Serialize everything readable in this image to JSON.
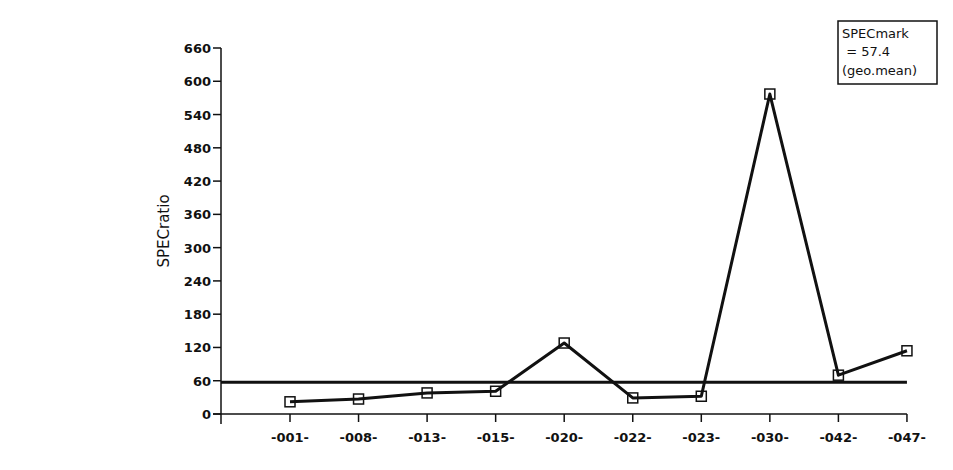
{
  "chart_data": {
    "type": "line",
    "title": "",
    "xlabel": "",
    "ylabel": "SPECratio",
    "categories": [
      "-001-",
      "-008-",
      "-013-",
      "-015-",
      "-020-",
      "-022-",
      "-023-",
      "-030-",
      "-042-",
      "-047-"
    ],
    "series": [
      {
        "name": "SPECratio",
        "values": [
          22,
          27,
          38,
          41,
          128,
          29,
          32,
          577,
          70,
          114
        ]
      }
    ],
    "reference_line": {
      "label": "geo.mean",
      "value": 57.4
    },
    "yticks": [
      0,
      60,
      120,
      180,
      240,
      300,
      360,
      420,
      480,
      540,
      600,
      660
    ],
    "ylim": [
      0,
      660
    ],
    "grid": false,
    "legend": {
      "position": "top-right",
      "lines": [
        "SPECmark",
        " = 57.4",
        "(geo.mean)"
      ]
    },
    "marker": "open-square"
  },
  "legend": {
    "line1": "SPECmark",
    "line2": " = 57.4",
    "line3": "(geo.mean)"
  },
  "axis": {
    "ylabel": "SPECratio"
  }
}
